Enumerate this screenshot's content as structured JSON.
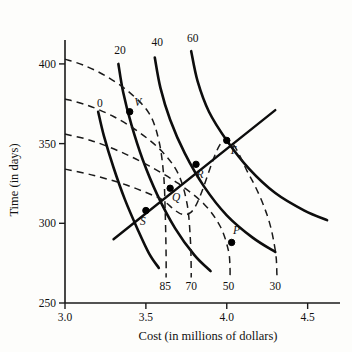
{
  "chart_data": {
    "type": "line",
    "title": "",
    "xlabel": "Cost (in millions of dollars)",
    "ylabel": "Time (in days)",
    "xlim": [
      3.0,
      4.7
    ],
    "ylim": [
      250,
      415
    ],
    "xticks": [
      "3.0",
      "3.5",
      "4.0",
      "4.5"
    ],
    "xtick_values": [
      3.0,
      3.5,
      4.0,
      4.5
    ],
    "yticks": [
      "250",
      "300",
      "350",
      "400"
    ],
    "ytick_values": [
      250,
      300,
      350,
      400
    ],
    "grid": false,
    "legend": "none",
    "solid_family_name": "solid contours",
    "dashed_family_name": "dashed contours",
    "solid_labels": [
      "0",
      "20",
      "40",
      "60"
    ],
    "dashed_labels": [
      "85",
      "70",
      "50",
      "30"
    ],
    "series": [
      {
        "name": "0",
        "style": "solid",
        "label": "0",
        "label_xy": [
          3.215,
          373
        ],
        "points": [
          [
            3.205,
            370
          ],
          [
            3.24,
            355
          ],
          [
            3.3,
            335
          ],
          [
            3.37,
            315
          ],
          [
            3.45,
            296
          ],
          [
            3.52,
            281
          ],
          [
            3.58,
            272
          ]
        ]
      },
      {
        "name": "20",
        "style": "solid",
        "label": "20",
        "label_xy": [
          3.34,
          406
        ],
        "points": [
          [
            3.33,
            400
          ],
          [
            3.36,
            382
          ],
          [
            3.41,
            362
          ],
          [
            3.48,
            340
          ],
          [
            3.57,
            318
          ],
          [
            3.68,
            297
          ],
          [
            3.8,
            280
          ],
          [
            3.9,
            270
          ]
        ]
      },
      {
        "name": "40",
        "style": "solid",
        "label": "40",
        "label_xy": [
          3.57,
          411
        ],
        "points": [
          [
            3.555,
            404
          ],
          [
            3.59,
            385
          ],
          [
            3.65,
            365
          ],
          [
            3.74,
            344
          ],
          [
            3.86,
            323
          ],
          [
            4.0,
            305
          ],
          [
            4.16,
            291
          ],
          [
            4.3,
            282
          ]
        ]
      },
      {
        "name": "60",
        "style": "solid",
        "label": "60",
        "label_xy": [
          3.79,
          414
        ],
        "points": [
          [
            3.78,
            408
          ],
          [
            3.82,
            389
          ],
          [
            3.89,
            370
          ],
          [
            4.0,
            352
          ],
          [
            4.14,
            334
          ],
          [
            4.3,
            319
          ],
          [
            4.48,
            308
          ],
          [
            4.62,
            302
          ]
        ]
      },
      {
        "name": "85",
        "style": "dashed",
        "label": "85",
        "label_xy": [
          3.62,
          258
        ],
        "points": [
          [
            3.0,
            403
          ],
          [
            3.12,
            399
          ],
          [
            3.26,
            392
          ],
          [
            3.4,
            382
          ],
          [
            3.52,
            369
          ],
          [
            3.58,
            352
          ],
          [
            3.61,
            330
          ],
          [
            3.62,
            305
          ],
          [
            3.625,
            280
          ],
          [
            3.625,
            266
          ]
        ]
      },
      {
        "name": "70",
        "style": "dashed",
        "label": "70",
        "label_xy": [
          3.78,
          258
        ],
        "points": [
          [
            3.0,
            378
          ],
          [
            3.14,
            374
          ],
          [
            3.3,
            367
          ],
          [
            3.46,
            357
          ],
          [
            3.6,
            345
          ],
          [
            3.7,
            331
          ],
          [
            3.755,
            312
          ],
          [
            3.775,
            290
          ],
          [
            3.78,
            272
          ],
          [
            3.78,
            266
          ]
        ]
      },
      {
        "name": "50",
        "style": "dashed",
        "label": "50",
        "label_xy": [
          4.01,
          258
        ],
        "points": [
          [
            3.0,
            356
          ],
          [
            3.16,
            352
          ],
          [
            3.34,
            345
          ],
          [
            3.52,
            336
          ],
          [
            3.7,
            325
          ],
          [
            3.86,
            312
          ],
          [
            3.96,
            298
          ],
          [
            4.01,
            283
          ],
          [
            4.02,
            272
          ],
          [
            4.02,
            266
          ]
        ]
      },
      {
        "name": "30",
        "style": "dashed",
        "label": "30",
        "label_xy": [
          4.3,
          258
        ],
        "points": [
          [
            3.0,
            334
          ],
          [
            3.18,
            330
          ],
          [
            3.38,
            324
          ],
          [
            3.58,
            316
          ],
          [
            3.78,
            307
          ],
          [
            3.98,
            352
          ],
          [
            4.14,
            330
          ],
          [
            4.25,
            305
          ],
          [
            4.3,
            283
          ],
          [
            4.31,
            268
          ],
          [
            4.31,
            266
          ]
        ]
      },
      {
        "name": "tradeoff-line",
        "style": "straight",
        "label": "",
        "points": [
          [
            3.3,
            290
          ],
          [
            4.3,
            371
          ]
        ]
      }
    ],
    "points": [
      {
        "label": "P",
        "x": 4.03,
        "y": 288,
        "label_dx": 5,
        "label_dy": -8
      },
      {
        "label": "Q",
        "x": 3.65,
        "y": 322,
        "label_dx": 6,
        "label_dy": 13
      },
      {
        "label": "R",
        "x": 3.81,
        "y": 337,
        "label_dx": 4,
        "label_dy": 14
      },
      {
        "label": "S",
        "x": 3.5,
        "y": 308,
        "label_dx": -3,
        "label_dy": 14
      },
      {
        "label": "T",
        "x": 4.0,
        "y": 352,
        "label_dx": 6,
        "label_dy": 14
      },
      {
        "label": "V",
        "x": 3.4,
        "y": 370,
        "label_dx": 8,
        "label_dy": -6
      }
    ],
    "colors": {
      "background": "#fdfdfb",
      "axis": "#1a1a1a",
      "solid_curve": "#0d0d0d",
      "dashed_curve": "#1a1a1a",
      "marker": "#000000",
      "text": "#111111"
    }
  }
}
